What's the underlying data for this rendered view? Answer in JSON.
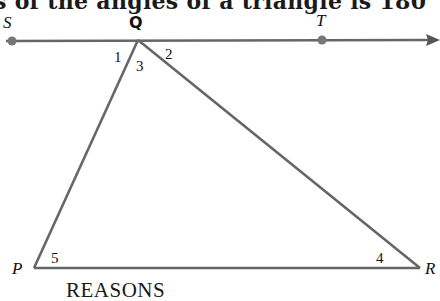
{
  "header": {
    "text": "s of the angles of a triangle is 180"
  },
  "figure": {
    "line_color": "#666666",
    "point_color": "#777777",
    "text_color": "#111111",
    "points": {
      "S": {
        "label": "S",
        "x": 12,
        "y": 41
      },
      "Q": {
        "label": "Q",
        "x": 138,
        "y": 40
      },
      "T": {
        "label": "T",
        "x": 322,
        "y": 40
      },
      "P": {
        "label": "P",
        "x": 34,
        "y": 268
      },
      "R": {
        "label": "R",
        "x": 420,
        "y": 268
      }
    },
    "angles": [
      {
        "label": "1",
        "location": "at Q, between QS and QP"
      },
      {
        "label": "2",
        "location": "at Q, between QT and QR"
      },
      {
        "label": "3",
        "location": "at Q, between QP and QR"
      },
      {
        "label": "4",
        "location": "at R, interior"
      },
      {
        "label": "5",
        "location": "at P, interior"
      }
    ]
  },
  "footer": {
    "reasons_heading": "REASONS"
  }
}
